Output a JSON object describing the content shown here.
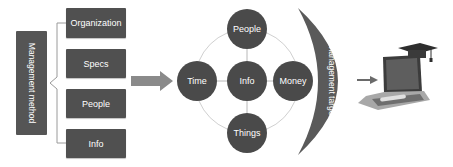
{
  "method": {
    "label": "Management method",
    "items": [
      {
        "label": "Organization"
      },
      {
        "label": "Specs"
      },
      {
        "label": "People"
      },
      {
        "label": "Info"
      }
    ]
  },
  "elements": {
    "center": "Info",
    "top": "People",
    "left": "Time",
    "right": "Money",
    "bottom": "Things"
  },
  "target": {
    "label": "Management target"
  },
  "result": {
    "icon": "laptop-with-graduation-cap"
  },
  "colors": {
    "box": "#505050",
    "circle": "#4a4a4a",
    "crescent": "#5a5a5a",
    "arrow": "#8a8a8a",
    "connector": "#c8c8c8"
  }
}
